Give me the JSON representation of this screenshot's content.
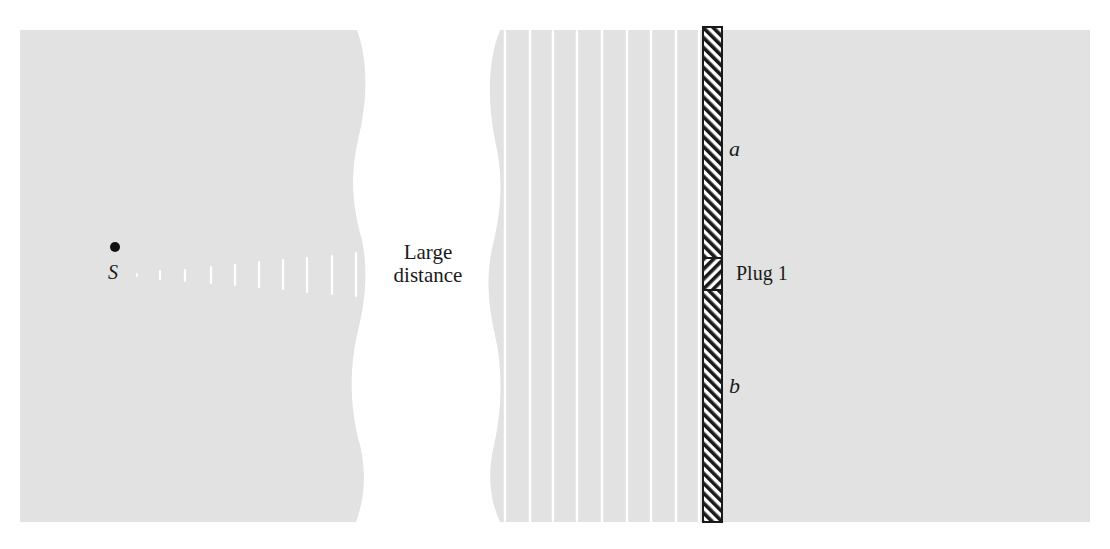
{
  "figure": {
    "type": "physics-diagram"
  },
  "labels": {
    "source": "S",
    "gap": "Large distance",
    "gap_line1": "Large",
    "gap_line2": "distance",
    "upper_barrier": "a",
    "lower_barrier": "b",
    "plug": "Plug 1"
  },
  "colors": {
    "panel_fill": "#e2e2e2",
    "wavefront": "#ffffff",
    "barrier_stroke": "#1a1a1a",
    "background": "#ffffff"
  },
  "left_panel": {
    "source_point": {
      "x": 115,
      "y": 273
    },
    "wavefront_count": 10
  },
  "right_panel": {
    "plane_wavefront_count": 9,
    "barrier": {
      "x": 703,
      "width": 19,
      "top": 27,
      "bottom": 522
    },
    "plug_region": {
      "top": 258,
      "bottom": 290
    }
  }
}
